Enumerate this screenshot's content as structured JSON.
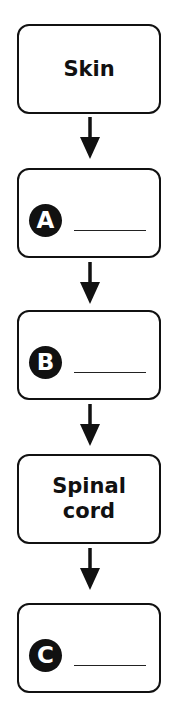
{
  "diagram": {
    "type": "vertical-flowchart",
    "nodes": [
      {
        "id": "skin",
        "label": "Skin",
        "kind": "text"
      },
      {
        "id": "a",
        "marker": "A",
        "kind": "blank"
      },
      {
        "id": "b",
        "marker": "B",
        "kind": "blank"
      },
      {
        "id": "spinal_cord",
        "label": "Spinal cord",
        "kind": "text"
      },
      {
        "id": "c",
        "marker": "C",
        "kind": "blank"
      }
    ],
    "edges": [
      [
        "skin",
        "a"
      ],
      [
        "a",
        "b"
      ],
      [
        "b",
        "spinal_cord"
      ],
      [
        "spinal_cord",
        "c"
      ]
    ]
  },
  "nodes": {
    "skin": "Skin",
    "a_marker": "A",
    "b_marker": "B",
    "spinal_line1": "Spinal",
    "spinal_line2": "cord",
    "c_marker": "C"
  },
  "colors": {
    "stroke": "#111111",
    "background": "#ffffff"
  }
}
